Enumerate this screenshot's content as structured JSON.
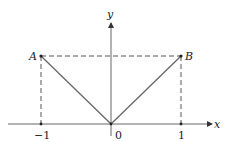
{
  "diagram": {
    "axes": {
      "x_label": "x",
      "y_label": "y"
    },
    "ticks": [
      {
        "label": "−1",
        "value": -1
      },
      {
        "label": "0",
        "value": 0
      },
      {
        "label": "1",
        "value": 1
      }
    ],
    "points": [
      {
        "label": "A",
        "coords": [
          -1,
          1
        ]
      },
      {
        "label": "B",
        "coords": [
          1,
          1
        ]
      }
    ],
    "colors": {
      "solid": "#666666",
      "dashed": "#555555",
      "text": "#222222"
    }
  }
}
